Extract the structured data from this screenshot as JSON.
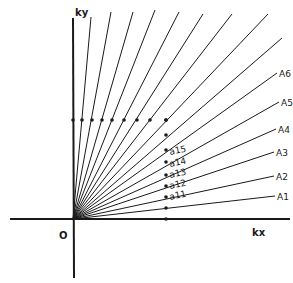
{
  "diagram": {
    "origin_label": "O",
    "x_axis_label": "kx",
    "y_axis_label": "ky",
    "origin": [
      73,
      219
    ],
    "ray_endpoints": [
      [
        91,
        17
      ],
      [
        111,
        12
      ],
      [
        133,
        12
      ],
      [
        155,
        10
      ],
      [
        179,
        12
      ],
      [
        203,
        14
      ],
      [
        232,
        14
      ],
      [
        268,
        14
      ],
      [
        282,
        38
      ],
      [
        277,
        73
      ],
      [
        279,
        102
      ],
      [
        276,
        129
      ],
      [
        274,
        152
      ],
      [
        274,
        176
      ],
      [
        275,
        196
      ]
    ],
    "A_labels": [
      {
        "text": "A6",
        "x": 279,
        "y": 77
      },
      {
        "text": "A5",
        "x": 281,
        "y": 106
      },
      {
        "text": "A4",
        "x": 278,
        "y": 133
      },
      {
        "text": "A3",
        "x": 276,
        "y": 156
      },
      {
        "text": "A2",
        "x": 276,
        "y": 180
      },
      {
        "text": "A1",
        "x": 277,
        "y": 200
      }
    ],
    "a_labels": [
      {
        "text": "a15",
        "x": 170,
        "y": 155
      },
      {
        "text": "a14",
        "x": 170,
        "y": 167
      },
      {
        "text": "a13",
        "x": 170,
        "y": 178
      },
      {
        "text": "a12",
        "x": 170,
        "y": 189
      },
      {
        "text": "a11",
        "x": 170,
        "y": 200
      }
    ],
    "row_dots_y": 120,
    "row_dots_x": [
      73,
      82,
      92,
      102,
      112,
      124,
      137,
      150,
      166
    ],
    "column_dots_x": 166,
    "column_dots_y": [
      120,
      135,
      150,
      162,
      175,
      186,
      197,
      208,
      219
    ],
    "line_color": "#1a1a1a"
  }
}
